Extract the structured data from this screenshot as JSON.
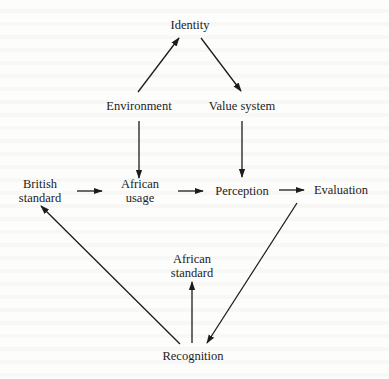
{
  "diagram": {
    "type": "flow-diagram",
    "nodes": {
      "identity": {
        "label": "Identity"
      },
      "environment": {
        "label": "Environment"
      },
      "value_system": {
        "label": "Value system"
      },
      "british_standard": {
        "line1": "British",
        "line2": "standard"
      },
      "african_usage": {
        "line1": "African",
        "line2": "usage"
      },
      "perception": {
        "label": "Perception"
      },
      "evaluation": {
        "label": "Evaluation"
      },
      "african_standard": {
        "line1": "African",
        "line2": "standard"
      },
      "recognition": {
        "label": "Recognition"
      }
    },
    "edges": [
      {
        "from": "Environment",
        "to": "Identity"
      },
      {
        "from": "Identity",
        "to": "Value system"
      },
      {
        "from": "Environment",
        "to": "African usage"
      },
      {
        "from": "Value system",
        "to": "Perception"
      },
      {
        "from": "British standard",
        "to": "African usage"
      },
      {
        "from": "African usage",
        "to": "Perception"
      },
      {
        "from": "Perception",
        "to": "Evaluation"
      },
      {
        "from": "Evaluation",
        "to": "Recognition"
      },
      {
        "from": "Recognition",
        "to": "British standard"
      },
      {
        "from": "Recognition",
        "to": "African standard"
      }
    ],
    "colors": {
      "ink": "#1c1c1c",
      "paper": "#fdfdfc"
    }
  }
}
